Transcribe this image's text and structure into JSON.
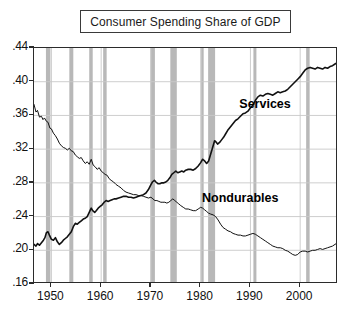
{
  "title": "Consumer Spending Share of GDP",
  "chart_data": {
    "type": "line",
    "title": "Consumer Spending Share of GDP",
    "xlabel": "",
    "ylabel": "",
    "xlim": [
      1946.5,
      2007.6
    ],
    "ylim": [
      0.16,
      0.44
    ],
    "grid": true,
    "legend_position": "inline-annotations",
    "ytick_labels": [
      ".44",
      ".40",
      ".36",
      ".32",
      ".28",
      ".24",
      ".20",
      ".16"
    ],
    "ytick_values": [
      0.44,
      0.4,
      0.36,
      0.32,
      0.28,
      0.24,
      0.2,
      0.16
    ],
    "xtick_labels": [
      "1950",
      "1960",
      "1970",
      "1980",
      "1990",
      "2000"
    ],
    "xtick_values": [
      1950,
      1960,
      1970,
      1980,
      1990,
      2000
    ],
    "annotations": [
      {
        "text": "Services",
        "x": 1994.0,
        "y": 0.372
      },
      {
        "text": "Nondurables",
        "x": 1986.5,
        "y": 0.261
      }
    ],
    "shaded_regions_label": "NBER recessions",
    "shaded_regions": [
      {
        "start": 1948.9,
        "end": 1949.8
      },
      {
        "start": 1953.6,
        "end": 1954.4
      },
      {
        "start": 1957.6,
        "end": 1958.3
      },
      {
        "start": 1960.4,
        "end": 1961.1
      },
      {
        "start": 1969.9,
        "end": 1970.8
      },
      {
        "start": 1973.9,
        "end": 1975.2
      },
      {
        "start": 1980.1,
        "end": 1980.6
      },
      {
        "start": 1981.5,
        "end": 1982.9
      },
      {
        "start": 1990.6,
        "end": 1991.2
      },
      {
        "start": 2001.2,
        "end": 2001.9
      }
    ],
    "series": [
      {
        "name": "Services",
        "x": [
          1946.5,
          1947.0,
          1947.5,
          1948.0,
          1948.5,
          1949.0,
          1949.5,
          1950.0,
          1950.5,
          1951.0,
          1951.5,
          1952.0,
          1952.5,
          1953.0,
          1953.5,
          1954.0,
          1954.5,
          1955.0,
          1955.5,
          1956.0,
          1956.5,
          1957.0,
          1957.5,
          1958.0,
          1958.5,
          1959.0,
          1959.5,
          1960.0,
          1960.5,
          1961.0,
          1961.5,
          1962.0,
          1962.5,
          1963.0,
          1963.5,
          1964.0,
          1964.5,
          1965.0,
          1965.5,
          1966.0,
          1966.5,
          1967.0,
          1967.5,
          1968.0,
          1968.5,
          1969.0,
          1969.5,
          1970.0,
          1970.5,
          1971.0,
          1971.5,
          1972.0,
          1972.5,
          1973.0,
          1973.5,
          1974.0,
          1974.5,
          1975.0,
          1975.5,
          1976.0,
          1976.5,
          1977.0,
          1977.5,
          1978.0,
          1978.5,
          1979.0,
          1979.5,
          1980.0,
          1980.5,
          1981.0,
          1981.5,
          1982.0,
          1982.5,
          1983.0,
          1983.5,
          1984.0,
          1984.5,
          1985.0,
          1985.5,
          1986.0,
          1986.5,
          1987.0,
          1987.5,
          1988.0,
          1988.5,
          1989.0,
          1989.5,
          1990.0,
          1990.5,
          1991.0,
          1991.5,
          1992.0,
          1992.5,
          1993.0,
          1993.5,
          1994.0,
          1994.5,
          1995.0,
          1995.5,
          1996.0,
          1996.5,
          1997.0,
          1997.5,
          1998.0,
          1998.5,
          1999.0,
          1999.5,
          2000.0,
          2000.5,
          2001.0,
          2001.5,
          2002.0,
          2002.5,
          2003.0,
          2003.5,
          2004.0,
          2004.5,
          2005.0,
          2005.5,
          2006.0,
          2006.5,
          2007.0,
          2007.5
        ],
        "y": [
          0.373,
          0.366,
          0.361,
          0.358,
          0.359,
          0.357,
          0.352,
          0.348,
          0.341,
          0.333,
          0.33,
          0.327,
          0.324,
          0.322,
          0.32,
          0.321,
          0.318,
          0.314,
          0.31,
          0.307,
          0.305,
          0.303,
          0.301,
          0.307,
          0.3,
          0.297,
          0.294,
          0.292,
          0.29,
          0.289,
          0.286,
          0.283,
          0.281,
          0.279,
          0.277,
          0.275,
          0.273,
          0.271,
          0.269,
          0.267,
          0.266,
          0.267,
          0.266,
          0.265,
          0.264,
          0.264,
          0.263,
          0.263,
          0.264,
          0.265,
          0.265,
          0.264,
          0.263,
          0.262,
          0.261,
          0.262,
          0.263,
          0.262,
          0.259,
          0.257,
          0.256,
          0.254,
          0.252,
          0.25,
          0.249,
          0.248,
          0.25,
          0.252,
          0.251,
          0.249,
          0.248,
          0.247,
          0.244,
          0.243,
          0.241,
          0.238,
          0.236,
          0.236,
          0.235,
          0.233,
          0.231,
          0.229,
          0.226,
          0.224,
          0.222,
          0.221,
          0.22,
          0.219,
          0.218,
          0.219,
          0.218,
          0.217,
          0.216,
          0.215,
          0.214,
          0.213,
          0.212,
          0.211,
          0.21,
          0.209,
          0.208,
          0.207,
          0.206,
          0.205,
          0.204,
          0.203,
          0.202,
          0.201,
          0.2,
          0.199,
          0.198,
          0.197,
          0.196,
          0.195,
          0.194,
          0.193,
          0.192,
          0.191,
          0.19,
          0.189,
          0.188,
          0.187,
          0.186
        ]
      }
    ],
    "note": "Services rises from ~.21 (1946) to ~.42 (2007); Nondurables falls from ~.37 (1946) to ~.21 (2007). Actual plotted paths encoded in series_paths."
  },
  "series_paths": {
    "nondurables": [
      [
        1946.5,
        0.373
      ],
      [
        1946.9,
        0.364
      ],
      [
        1947.2,
        0.366
      ],
      [
        1947.6,
        0.358
      ],
      [
        1948.0,
        0.359
      ],
      [
        1948.3,
        0.355
      ],
      [
        1948.6,
        0.357
      ],
      [
        1949.0,
        0.353
      ],
      [
        1949.3,
        0.352
      ],
      [
        1949.7,
        0.345
      ],
      [
        1950.0,
        0.344
      ],
      [
        1950.4,
        0.339
      ],
      [
        1950.8,
        0.336
      ],
      [
        1951.2,
        0.332
      ],
      [
        1951.6,
        0.327
      ],
      [
        1952.0,
        0.324
      ],
      [
        1952.4,
        0.322
      ],
      [
        1952.8,
        0.321
      ],
      [
        1953.2,
        0.319
      ],
      [
        1953.6,
        0.321
      ],
      [
        1954.0,
        0.318
      ],
      [
        1954.4,
        0.317
      ],
      [
        1954.8,
        0.313
      ],
      [
        1955.2,
        0.311
      ],
      [
        1955.6,
        0.309
      ],
      [
        1956.0,
        0.31
      ],
      [
        1956.4,
        0.306
      ],
      [
        1956.8,
        0.303
      ],
      [
        1957.2,
        0.305
      ],
      [
        1957.6,
        0.302
      ],
      [
        1958.0,
        0.308
      ],
      [
        1958.4,
        0.301
      ],
      [
        1958.8,
        0.299
      ],
      [
        1959.2,
        0.296
      ],
      [
        1959.6,
        0.298
      ],
      [
        1960.0,
        0.294
      ],
      [
        1960.4,
        0.292
      ],
      [
        1960.8,
        0.29
      ],
      [
        1961.2,
        0.289
      ],
      [
        1961.6,
        0.285
      ],
      [
        1962.0,
        0.283
      ],
      [
        1962.5,
        0.281
      ],
      [
        1963.0,
        0.278
      ],
      [
        1963.5,
        0.276
      ],
      [
        1964.0,
        0.274
      ],
      [
        1964.5,
        0.271
      ],
      [
        1965.0,
        0.269
      ],
      [
        1965.5,
        0.268
      ],
      [
        1966.0,
        0.267
      ],
      [
        1966.5,
        0.266
      ],
      [
        1967.0,
        0.266
      ],
      [
        1967.5,
        0.265
      ],
      [
        1968.0,
        0.265
      ],
      [
        1968.5,
        0.264
      ],
      [
        1969.0,
        0.263
      ],
      [
        1969.5,
        0.262
      ],
      [
        1970.0,
        0.263
      ],
      [
        1970.4,
        0.261
      ],
      [
        1970.8,
        0.259
      ],
      [
        1971.2,
        0.259
      ],
      [
        1971.6,
        0.258
      ],
      [
        1972.0,
        0.257
      ],
      [
        1972.4,
        0.257
      ],
      [
        1972.8,
        0.257
      ],
      [
        1973.2,
        0.256
      ],
      [
        1973.6,
        0.257
      ],
      [
        1974.0,
        0.259
      ],
      [
        1974.4,
        0.261
      ],
      [
        1974.8,
        0.259
      ],
      [
        1975.2,
        0.257
      ],
      [
        1975.6,
        0.255
      ],
      [
        1976.0,
        0.253
      ],
      [
        1976.5,
        0.251
      ],
      [
        1977.0,
        0.249
      ],
      [
        1977.5,
        0.249
      ],
      [
        1978.0,
        0.248
      ],
      [
        1978.5,
        0.247
      ],
      [
        1979.0,
        0.247
      ],
      [
        1979.5,
        0.249
      ],
      [
        1980.0,
        0.251
      ],
      [
        1980.4,
        0.25
      ],
      [
        1980.8,
        0.248
      ],
      [
        1981.2,
        0.246
      ],
      [
        1981.6,
        0.244
      ],
      [
        1982.0,
        0.243
      ],
      [
        1982.5,
        0.242
      ],
      [
        1983.0,
        0.24
      ],
      [
        1983.5,
        0.236
      ],
      [
        1984.0,
        0.231
      ],
      [
        1984.5,
        0.227
      ],
      [
        1985.0,
        0.225
      ],
      [
        1985.5,
        0.223
      ],
      [
        1986.0,
        0.222
      ],
      [
        1986.5,
        0.22
      ],
      [
        1987.0,
        0.219
      ],
      [
        1987.5,
        0.218
      ],
      [
        1988.0,
        0.218
      ],
      [
        1988.5,
        0.217
      ],
      [
        1989.0,
        0.217
      ],
      [
        1989.5,
        0.218
      ],
      [
        1990.0,
        0.219
      ],
      [
        1990.5,
        0.22
      ],
      [
        1991.0,
        0.219
      ],
      [
        1991.5,
        0.217
      ],
      [
        1992.0,
        0.215
      ],
      [
        1992.5,
        0.213
      ],
      [
        1993.0,
        0.211
      ],
      [
        1993.5,
        0.209
      ],
      [
        1994.0,
        0.207
      ],
      [
        1994.5,
        0.205
      ],
      [
        1995.0,
        0.204
      ],
      [
        1995.5,
        0.203
      ],
      [
        1996.0,
        0.203
      ],
      [
        1996.5,
        0.202
      ],
      [
        1997.0,
        0.2
      ],
      [
        1997.5,
        0.199
      ],
      [
        1998.0,
        0.197
      ],
      [
        1998.5,
        0.195
      ],
      [
        1999.0,
        0.194
      ],
      [
        1999.5,
        0.195
      ],
      [
        2000.0,
        0.198
      ],
      [
        2000.5,
        0.199
      ],
      [
        2001.0,
        0.199
      ],
      [
        2001.5,
        0.198
      ],
      [
        2002.0,
        0.199
      ],
      [
        2002.5,
        0.2
      ],
      [
        2003.0,
        0.2
      ],
      [
        2003.5,
        0.201
      ],
      [
        2004.0,
        0.202
      ],
      [
        2004.5,
        0.201
      ],
      [
        2005.0,
        0.202
      ],
      [
        2005.5,
        0.203
      ],
      [
        2006.0,
        0.204
      ],
      [
        2006.5,
        0.205
      ],
      [
        2007.0,
        0.207
      ],
      [
        2007.5,
        0.209
      ]
    ],
    "services": [
      [
        1946.5,
        0.207
      ],
      [
        1946.9,
        0.205
      ],
      [
        1947.2,
        0.208
      ],
      [
        1947.6,
        0.206
      ],
      [
        1948.0,
        0.209
      ],
      [
        1948.4,
        0.212
      ],
      [
        1948.7,
        0.215
      ],
      [
        1949.0,
        0.221
      ],
      [
        1949.3,
        0.222
      ],
      [
        1949.6,
        0.218
      ],
      [
        1950.0,
        0.213
      ],
      [
        1950.4,
        0.212
      ],
      [
        1950.8,
        0.215
      ],
      [
        1951.2,
        0.21
      ],
      [
        1951.6,
        0.207
      ],
      [
        1952.0,
        0.209
      ],
      [
        1952.4,
        0.212
      ],
      [
        1952.8,
        0.214
      ],
      [
        1953.2,
        0.216
      ],
      [
        1953.6,
        0.219
      ],
      [
        1954.0,
        0.222
      ],
      [
        1954.4,
        0.228
      ],
      [
        1954.8,
        0.232
      ],
      [
        1955.2,
        0.231
      ],
      [
        1955.6,
        0.233
      ],
      [
        1956.0,
        0.235
      ],
      [
        1956.4,
        0.237
      ],
      [
        1956.8,
        0.238
      ],
      [
        1957.2,
        0.24
      ],
      [
        1957.6,
        0.245
      ],
      [
        1958.0,
        0.25
      ],
      [
        1958.3,
        0.247
      ],
      [
        1958.7,
        0.245
      ],
      [
        1959.0,
        0.247
      ],
      [
        1959.4,
        0.25
      ],
      [
        1959.8,
        0.252
      ],
      [
        1960.2,
        0.254
      ],
      [
        1960.6,
        0.257
      ],
      [
        1961.0,
        0.259
      ],
      [
        1961.4,
        0.258
      ],
      [
        1961.8,
        0.259
      ],
      [
        1962.2,
        0.26
      ],
      [
        1962.6,
        0.261
      ],
      [
        1963.0,
        0.261
      ],
      [
        1963.5,
        0.262
      ],
      [
        1964.0,
        0.263
      ],
      [
        1964.5,
        0.264
      ],
      [
        1965.0,
        0.264
      ],
      [
        1965.5,
        0.263
      ],
      [
        1966.0,
        0.263
      ],
      [
        1966.5,
        0.262
      ],
      [
        1967.0,
        0.263
      ],
      [
        1967.5,
        0.264
      ],
      [
        1968.0,
        0.265
      ],
      [
        1968.5,
        0.266
      ],
      [
        1969.0,
        0.268
      ],
      [
        1969.5,
        0.272
      ],
      [
        1970.0,
        0.278
      ],
      [
        1970.3,
        0.281
      ],
      [
        1970.7,
        0.283
      ],
      [
        1971.0,
        0.281
      ],
      [
        1971.4,
        0.279
      ],
      [
        1971.8,
        0.279
      ],
      [
        1972.2,
        0.28
      ],
      [
        1972.6,
        0.28
      ],
      [
        1973.0,
        0.281
      ],
      [
        1973.4,
        0.283
      ],
      [
        1973.8,
        0.286
      ],
      [
        1974.2,
        0.29
      ],
      [
        1974.6,
        0.292
      ],
      [
        1975.0,
        0.294
      ],
      [
        1975.4,
        0.292
      ],
      [
        1975.8,
        0.293
      ],
      [
        1976.2,
        0.294
      ],
      [
        1976.6,
        0.293
      ],
      [
        1977.0,
        0.295
      ],
      [
        1977.5,
        0.296
      ],
      [
        1978.0,
        0.296
      ],
      [
        1978.5,
        0.295
      ],
      [
        1979.0,
        0.297
      ],
      [
        1979.5,
        0.3
      ],
      [
        1980.0,
        0.304
      ],
      [
        1980.4,
        0.308
      ],
      [
        1980.8,
        0.306
      ],
      [
        1981.2,
        0.303
      ],
      [
        1981.6,
        0.306
      ],
      [
        1982.0,
        0.314
      ],
      [
        1982.4,
        0.322
      ],
      [
        1982.8,
        0.33
      ],
      [
        1983.0,
        0.329
      ],
      [
        1983.4,
        0.326
      ],
      [
        1983.8,
        0.328
      ],
      [
        1984.2,
        0.331
      ],
      [
        1984.6,
        0.334
      ],
      [
        1985.0,
        0.338
      ],
      [
        1985.4,
        0.342
      ],
      [
        1985.8,
        0.345
      ],
      [
        1986.2,
        0.348
      ],
      [
        1986.6,
        0.351
      ],
      [
        1987.0,
        0.354
      ],
      [
        1987.5,
        0.356
      ],
      [
        1988.0,
        0.359
      ],
      [
        1988.5,
        0.362
      ],
      [
        1989.0,
        0.363
      ],
      [
        1989.5,
        0.365
      ],
      [
        1990.0,
        0.369
      ],
      [
        1990.5,
        0.372
      ],
      [
        1991.0,
        0.378
      ],
      [
        1991.5,
        0.382
      ],
      [
        1992.0,
        0.384
      ],
      [
        1992.5,
        0.383
      ],
      [
        1993.0,
        0.385
      ],
      [
        1993.5,
        0.386
      ],
      [
        1994.0,
        0.385
      ],
      [
        1994.5,
        0.384
      ],
      [
        1995.0,
        0.386
      ],
      [
        1995.5,
        0.388
      ],
      [
        1996.0,
        0.387
      ],
      [
        1996.5,
        0.388
      ],
      [
        1997.0,
        0.389
      ],
      [
        1997.5,
        0.391
      ],
      [
        1998.0,
        0.394
      ],
      [
        1998.5,
        0.397
      ],
      [
        1999.0,
        0.4
      ],
      [
        1999.5,
        0.403
      ],
      [
        2000.0,
        0.406
      ],
      [
        2000.5,
        0.41
      ],
      [
        2001.0,
        0.414
      ],
      [
        2001.5,
        0.416
      ],
      [
        2002.0,
        0.417
      ],
      [
        2002.5,
        0.416
      ],
      [
        2003.0,
        0.415
      ],
      [
        2003.5,
        0.417
      ],
      [
        2004.0,
        0.416
      ],
      [
        2004.5,
        0.415
      ],
      [
        2005.0,
        0.417
      ],
      [
        2005.5,
        0.416
      ],
      [
        2006.0,
        0.418
      ],
      [
        2006.5,
        0.419
      ],
      [
        2007.0,
        0.421
      ],
      [
        2007.5,
        0.423
      ]
    ]
  },
  "style": {
    "shade_color": "#b8b8b8",
    "grid_color": "#c8c8c8",
    "axis_color": "#2b2b2b",
    "line_color": "#111111",
    "background": "#ffffff"
  }
}
